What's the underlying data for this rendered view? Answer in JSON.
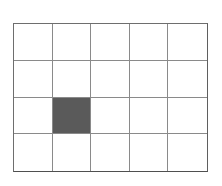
{
  "figure": {
    "background_color": "#ffffff",
    "width": 222,
    "height": 186
  },
  "grid": {
    "columns": 5,
    "rows": 4,
    "line_color": "#8a8a8a",
    "border_color": "#6e6e6e",
    "cell_background": "#ffffff",
    "filled_color": "#5a5a5a",
    "bounds": {
      "left": 13,
      "top": 23,
      "width": 195,
      "height": 149
    },
    "cell_size": {
      "width": 39,
      "height": 37
    },
    "filled_cells": [
      {
        "row": 3,
        "column": 2
      }
    ],
    "cells": [
      [
        {
          "row": 1,
          "column": 1,
          "filled": false
        },
        {
          "row": 1,
          "column": 2,
          "filled": false
        },
        {
          "row": 1,
          "column": 3,
          "filled": false
        },
        {
          "row": 1,
          "column": 4,
          "filled": false
        },
        {
          "row": 1,
          "column": 5,
          "filled": false
        }
      ],
      [
        {
          "row": 2,
          "column": 1,
          "filled": false
        },
        {
          "row": 2,
          "column": 2,
          "filled": false
        },
        {
          "row": 2,
          "column": 3,
          "filled": false
        },
        {
          "row": 2,
          "column": 4,
          "filled": false
        },
        {
          "row": 2,
          "column": 5,
          "filled": false
        }
      ],
      [
        {
          "row": 3,
          "column": 1,
          "filled": false
        },
        {
          "row": 3,
          "column": 2,
          "filled": true
        },
        {
          "row": 3,
          "column": 3,
          "filled": false
        },
        {
          "row": 3,
          "column": 4,
          "filled": false
        },
        {
          "row": 3,
          "column": 5,
          "filled": false
        }
      ],
      [
        {
          "row": 4,
          "column": 1,
          "filled": false
        },
        {
          "row": 4,
          "column": 2,
          "filled": false
        },
        {
          "row": 4,
          "column": 3,
          "filled": false
        },
        {
          "row": 4,
          "column": 4,
          "filled": false
        },
        {
          "row": 4,
          "column": 5,
          "filled": false
        }
      ]
    ]
  }
}
